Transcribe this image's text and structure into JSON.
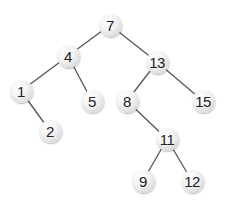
{
  "diagram": {
    "type": "binary-search-tree",
    "line_color": "#555555",
    "node_fill": "#ececec",
    "text_color": "#222222",
    "nodes": [
      {
        "id": "n7",
        "label": "7",
        "x": 110,
        "y": 25
      },
      {
        "id": "n4",
        "label": "4",
        "x": 68,
        "y": 56
      },
      {
        "id": "n13",
        "label": "13",
        "x": 157,
        "y": 62
      },
      {
        "id": "n1",
        "label": "1",
        "x": 21,
        "y": 91
      },
      {
        "id": "n5",
        "label": "5",
        "x": 92,
        "y": 101
      },
      {
        "id": "n8",
        "label": "8",
        "x": 127,
        "y": 101
      },
      {
        "id": "n15",
        "label": "15",
        "x": 203,
        "y": 101
      },
      {
        "id": "n2",
        "label": "2",
        "x": 50,
        "y": 131
      },
      {
        "id": "n11",
        "label": "11",
        "x": 167,
        "y": 139
      },
      {
        "id": "n9",
        "label": "9",
        "x": 143,
        "y": 181
      },
      {
        "id": "n12",
        "label": "12",
        "x": 192,
        "y": 181
      }
    ],
    "edges": [
      {
        "from": "7",
        "to": "4"
      },
      {
        "from": "7",
        "to": "13"
      },
      {
        "from": "4",
        "to": "1"
      },
      {
        "from": "4",
        "to": "5"
      },
      {
        "from": "1",
        "to": "2"
      },
      {
        "from": "13",
        "to": "8"
      },
      {
        "from": "13",
        "to": "15"
      },
      {
        "from": "8",
        "to": "11"
      },
      {
        "from": "11",
        "to": "9"
      },
      {
        "from": "11",
        "to": "12"
      }
    ]
  }
}
